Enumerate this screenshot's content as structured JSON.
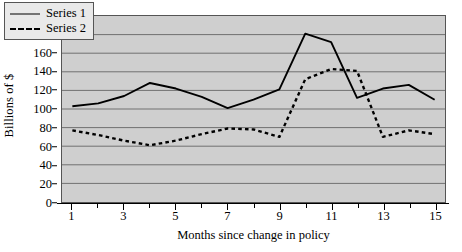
{
  "chart_data": {
    "type": "line",
    "title": "",
    "xlabel": "Months since change in policy",
    "ylabel": "Billions of $",
    "x": [
      1,
      2,
      3,
      4,
      5,
      6,
      7,
      8,
      9,
      10,
      11,
      12,
      13,
      14,
      15
    ],
    "xlim": [
      0.6,
      15.4
    ],
    "ylim": [
      0,
      200
    ],
    "yticks": [
      0,
      20,
      40,
      60,
      80,
      100,
      120,
      140,
      160,
      180,
      200
    ],
    "xticks_labeled": [
      1,
      3,
      5,
      7,
      9,
      11,
      13,
      15
    ],
    "xticks_all": [
      1,
      2,
      3,
      4,
      5,
      6,
      7,
      8,
      9,
      10,
      11,
      12,
      13,
      14,
      15
    ],
    "grid": true,
    "grid_axis": "y",
    "legend_position": "top-left",
    "plot_background": "#cfcfcf",
    "line_color": "#000000",
    "series": [
      {
        "name": "Series 1",
        "style": "solid",
        "values": [
          103,
          106,
          114,
          128,
          122,
          113,
          101,
          110,
          121,
          181,
          172,
          112,
          122,
          126,
          110
        ]
      },
      {
        "name": "Series 2",
        "style": "dashed",
        "values": [
          77,
          72,
          66,
          61,
          66,
          73,
          79,
          78,
          70,
          132,
          143,
          141,
          70,
          77,
          73
        ]
      }
    ]
  },
  "legend": {
    "entries": [
      {
        "label": "Series 1"
      },
      {
        "label": "Series 2"
      }
    ]
  },
  "axes": {
    "y_title": "Billions of $",
    "x_title": "Months since change in policy"
  }
}
